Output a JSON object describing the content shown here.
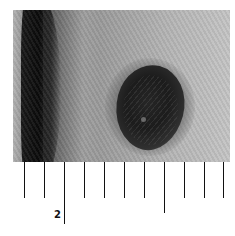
{
  "image": {
    "subject": "skin-lesion-photo",
    "description": "Dark pigmented skin lesion on textured skin with dark fold at left"
  },
  "ruler": {
    "tick_positions_px": [
      24,
      44,
      64,
      84,
      104,
      124,
      144,
      164,
      184,
      204,
      223
    ],
    "long_ticks": [
      64,
      164
    ],
    "labels": [
      {
        "text": "2",
        "x": 54,
        "y": 209
      }
    ]
  }
}
